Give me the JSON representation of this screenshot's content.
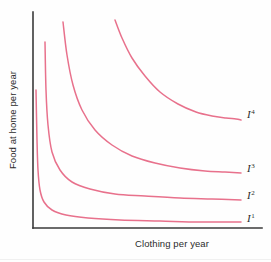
{
  "figure": {
    "background_color": "#fefefe",
    "caption_fragment": "",
    "axis_color": "#3a3a3a",
    "curve_color": "#e8718c",
    "text_color": "#2b2b2b"
  },
  "chart_data": {
    "type": "line",
    "title": "",
    "subtitle": "",
    "xlabel": "Clothing per year",
    "ylabel": "Food at home per year",
    "grid": false,
    "legend_position": "inline-right-of-curve-ends",
    "axis_ticks": [],
    "xlim": [
      0,
      100
    ],
    "ylim": [
      0,
      100
    ],
    "annotations": [],
    "series": [
      {
        "name": "I1",
        "label": "I",
        "superscript": "1",
        "description": "lowest indifference curve",
        "color": "#e8718c",
        "label_x": 247,
        "label_y": 222,
        "points": [
          [
            36,
            90
          ],
          [
            37,
            140
          ],
          [
            38,
            170
          ],
          [
            40,
            190
          ],
          [
            44,
            202
          ],
          [
            52,
            210
          ],
          [
            66,
            215
          ],
          [
            88,
            218
          ],
          [
            120,
            220
          ],
          [
            160,
            221
          ],
          [
            200,
            222
          ],
          [
            241,
            222
          ]
        ]
      },
      {
        "name": "I2",
        "label": "I",
        "superscript": "2",
        "description": "second indifference curve",
        "color": "#e8718c",
        "label_x": 247,
        "label_y": 199,
        "points": [
          [
            45,
            42
          ],
          [
            46,
            90
          ],
          [
            48,
            125
          ],
          [
            52,
            152
          ],
          [
            60,
            170
          ],
          [
            72,
            182
          ],
          [
            90,
            189
          ],
          [
            115,
            194
          ],
          [
            145,
            196
          ],
          [
            180,
            198
          ],
          [
            212,
            199
          ],
          [
            241,
            200
          ]
        ]
      },
      {
        "name": "I3",
        "label": "I",
        "superscript": "3",
        "description": "third indifference curve",
        "color": "#e8718c",
        "label_x": 247,
        "label_y": 172,
        "points": [
          [
            63,
            22
          ],
          [
            67,
            55
          ],
          [
            73,
            85
          ],
          [
            82,
            110
          ],
          [
            95,
            130
          ],
          [
            112,
            145
          ],
          [
            132,
            156
          ],
          [
            155,
            163
          ],
          [
            180,
            168
          ],
          [
            205,
            171
          ],
          [
            225,
            172
          ],
          [
            241,
            173
          ]
        ]
      },
      {
        "name": "I4",
        "label": "I",
        "superscript": "4",
        "description": "highest indifference curve",
        "color": "#e8718c",
        "label_x": 247,
        "label_y": 118,
        "points": [
          [
            115,
            20
          ],
          [
            122,
            38
          ],
          [
            132,
            58
          ],
          [
            145,
            76
          ],
          [
            160,
            92
          ],
          [
            178,
            104
          ],
          [
            196,
            112
          ],
          [
            212,
            116
          ],
          [
            226,
            118
          ],
          [
            236,
            119
          ],
          [
            241,
            120
          ]
        ]
      }
    ],
    "axes": {
      "y_axis": {
        "x": 33,
        "y_top": 12,
        "y_bottom": 228
      },
      "x_axis": {
        "y": 228,
        "x_left": 33,
        "x_right": 262
      }
    }
  }
}
